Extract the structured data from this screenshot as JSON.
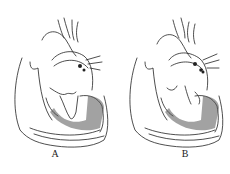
{
  "figure": {
    "panels": [
      {
        "id": "A",
        "label": "A",
        "description": "heart cross-section, valve closed"
      },
      {
        "id": "B",
        "label": "B",
        "description": "heart cross-section, valve open"
      }
    ],
    "colors": {
      "line": "#222222",
      "background": "#ffffff"
    }
  }
}
